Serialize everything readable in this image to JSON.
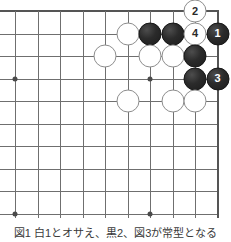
{
  "diagram": {
    "caption": "図1 白1とオサえ、黒2、図3が常型となる",
    "board": {
      "cols": 10,
      "rows": 10,
      "origin_x": 15,
      "origin_y": 11,
      "spacing": 22.5,
      "line_color": "#6f6f6f",
      "edge_color": "#555555",
      "background": "#ffffff",
      "top_edge_row": 0,
      "right_edge_col": 9,
      "star_points": [
        {
          "col": 0,
          "row": 3
        },
        {
          "col": 6,
          "row": 3
        },
        {
          "col": 0,
          "row": 9
        },
        {
          "col": 6,
          "row": 9
        }
      ]
    },
    "stone_colors": {
      "black": "#262626",
      "white": "#ffffff",
      "white_border": "#8d8d8d",
      "black_label": "#ffffff",
      "white_label": "#2a2a2a"
    },
    "stone_radius": 11.5,
    "stones": [
      {
        "id": "w-a",
        "col": 5,
        "row": 1,
        "color": "white",
        "label": ""
      },
      {
        "id": "b-a",
        "col": 6,
        "row": 1,
        "color": "black",
        "label": ""
      },
      {
        "id": "b-b",
        "col": 7,
        "row": 1,
        "color": "black",
        "label": ""
      },
      {
        "id": "w-move-4",
        "col": 8,
        "row": 1,
        "color": "white",
        "label": "4"
      },
      {
        "id": "b-move-1",
        "col": 9,
        "row": 1,
        "color": "black",
        "label": "1"
      },
      {
        "id": "w-move-2",
        "col": 8,
        "row": 0,
        "color": "white",
        "label": "2"
      },
      {
        "id": "w-b",
        "col": 4,
        "row": 2,
        "color": "white",
        "label": ""
      },
      {
        "id": "w-c",
        "col": 6,
        "row": 2,
        "color": "white",
        "label": ""
      },
      {
        "id": "w-d",
        "col": 7,
        "row": 2,
        "color": "white",
        "label": ""
      },
      {
        "id": "b-c",
        "col": 8,
        "row": 2,
        "color": "black",
        "label": ""
      },
      {
        "id": "b-d",
        "col": 8,
        "row": 3,
        "color": "black",
        "label": ""
      },
      {
        "id": "b-move-3",
        "col": 9,
        "row": 3,
        "color": "black",
        "label": "3"
      },
      {
        "id": "w-e",
        "col": 5,
        "row": 4,
        "color": "white",
        "label": ""
      },
      {
        "id": "w-f",
        "col": 7,
        "row": 4,
        "color": "white",
        "label": ""
      },
      {
        "id": "w-g",
        "col": 8,
        "row": 4,
        "color": "white",
        "label": ""
      }
    ],
    "moves": [
      {
        "number": "1",
        "color": "black"
      },
      {
        "number": "2",
        "color": "white"
      },
      {
        "number": "3",
        "color": "black"
      },
      {
        "number": "4",
        "color": "white"
      }
    ]
  }
}
